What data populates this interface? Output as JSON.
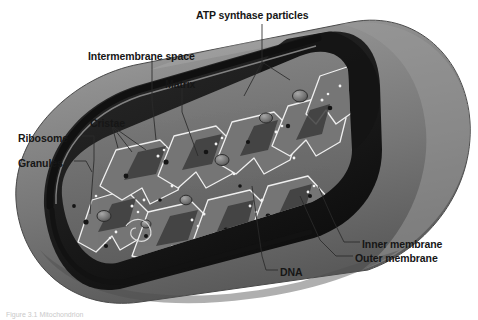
{
  "figure": {
    "subject": "mitochondrion",
    "background_color": "#ffffff",
    "style": "grayscale textbook illustration"
  },
  "colors": {
    "background": "#ffffff",
    "outer_body_light": "#9b9b9b",
    "outer_body_mid": "#7d7d7d",
    "outer_body_dark": "#636363",
    "outer_body_shadow": "#4e4e4e",
    "membrane_black": "#111111",
    "cavity_dark": "#1f1f1f",
    "matrix_mid": "#6f6f6f",
    "matrix_light": "#8d8d8d",
    "crista_outline": "#f2f2f2",
    "granule_dark": "#1a1a1a",
    "particle_white": "#f4f4f4",
    "label_text": "#161616",
    "leader_line": "#2a2a2a"
  },
  "labels": [
    {
      "id": "atp-synthase-particles",
      "text": "ATP synthase particles",
      "x": 196,
      "y": 10,
      "anchor": "left"
    },
    {
      "id": "intermembrane-space",
      "text": "Intermembrane space",
      "x": 88,
      "y": 51,
      "anchor": "left"
    },
    {
      "id": "matrix",
      "text": "Matrix",
      "x": 165,
      "y": 79,
      "anchor": "left"
    },
    {
      "id": "cristae",
      "text": "Cristae",
      "x": 90,
      "y": 118,
      "anchor": "left"
    },
    {
      "id": "ribosome",
      "text": "Ribosome",
      "x": 18,
      "y": 133,
      "anchor": "left"
    },
    {
      "id": "granules",
      "text": "Granules",
      "x": 18,
      "y": 158,
      "anchor": "left"
    },
    {
      "id": "inner-membrane",
      "text": "Inner membrane",
      "x": 362,
      "y": 239,
      "anchor": "left"
    },
    {
      "id": "outer-membrane",
      "text": "Outer membrane",
      "x": 355,
      "y": 253,
      "anchor": "left"
    },
    {
      "id": "dna",
      "text": "DNA",
      "x": 280,
      "y": 267,
      "anchor": "left"
    }
  ],
  "caption": {
    "text": "Figure 3.1 Mitochondrion"
  },
  "structures": [
    {
      "name": "outer-membrane",
      "description": "smooth outer boundary of the organelle"
    },
    {
      "name": "inner-membrane",
      "description": "folded membrane forming cristae"
    },
    {
      "name": "intermembrane-space",
      "description": "gap between inner and outer membranes"
    },
    {
      "name": "matrix",
      "description": "inner compartment enclosed by the inner membrane"
    },
    {
      "name": "cristae",
      "description": "finger-like folds of the inner membrane"
    },
    {
      "name": "atp-synthase-particles",
      "description": "small knobs on the cristae surface"
    },
    {
      "name": "ribosome",
      "description": "small dark granule in the matrix"
    },
    {
      "name": "granules",
      "description": "dense matrix granules"
    },
    {
      "name": "dna",
      "description": "mitochondrial DNA strand in the matrix"
    }
  ]
}
